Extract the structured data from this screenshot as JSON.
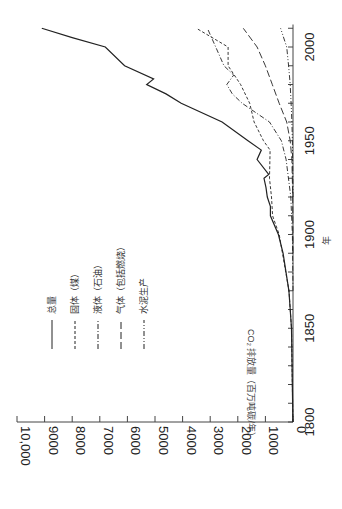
{
  "chart_data": {
    "type": "line",
    "orientation": "rotated-90",
    "title": "",
    "xlabel": "年",
    "ylabel": "CO₂ 排放量（百万吨碳/年）",
    "x_ticks": [
      "1800",
      "1850",
      "1900",
      "1950",
      "2000"
    ],
    "y_ticks": [
      "0",
      "1000",
      "2000",
      "3000",
      "4000",
      "5000",
      "6000",
      "7000",
      "8000",
      "9000",
      "10,000"
    ],
    "xlim": [
      1800,
      2012
    ],
    "ylim": [
      0,
      10000
    ],
    "grid": false,
    "legend_position": "upper-left (rotated)",
    "series": [
      {
        "name": "总量",
        "style": "solid",
        "x": [
          1800,
          1850,
          1870,
          1890,
          1900,
          1910,
          1915,
          1920,
          1925,
          1930,
          1932,
          1940,
          1945,
          1950,
          1960,
          1970,
          1975,
          1980,
          1983,
          1990,
          2000,
          2005,
          2010
        ],
        "values": [
          5,
          54,
          150,
          360,
          530,
          820,
          820,
          930,
          980,
          1050,
          880,
          1300,
          1150,
          1630,
          2570,
          4050,
          4600,
          5300,
          5050,
          6100,
          6800,
          8000,
          9100
        ]
      },
      {
        "name": "固体（煤）",
        "style": "dashed",
        "x": [
          1800,
          1850,
          1870,
          1900,
          1910,
          1920,
          1930,
          1945,
          1950,
          1960,
          1970,
          1980,
          1990,
          2000,
          2010
        ],
        "values": [
          5,
          54,
          145,
          500,
          740,
          780,
          850,
          830,
          1070,
          1410,
          1570,
          1900,
          2350,
          2350,
          3500
        ]
      },
      {
        "name": "液体（石油）",
        "style": "dash-dot",
        "x": [
          1870,
          1900,
          1920,
          1940,
          1950,
          1960,
          1970,
          1975,
          1980,
          1985,
          1990,
          2000,
          2010
        ],
        "values": [
          0,
          20,
          80,
          250,
          420,
          850,
          1840,
          2200,
          2400,
          2150,
          2500,
          2800,
          3100
        ]
      },
      {
        "name": "气体（包括燃烧）",
        "style": "long-dash",
        "x": [
          1890,
          1920,
          1940,
          1950,
          1960,
          1970,
          1980,
          1990,
          2000,
          2010
        ],
        "values": [
          0,
          10,
          40,
          100,
          230,
          500,
          750,
          1000,
          1300,
          1800
        ]
      },
      {
        "name": "水泥生产",
        "style": "dash-dot-dot",
        "x": [
          1920,
          1950,
          1960,
          1970,
          1980,
          1990,
          2000,
          2010
        ],
        "values": [
          0,
          20,
          40,
          70,
          100,
          160,
          230,
          450
        ]
      }
    ]
  },
  "axes": {
    "x_title": "年",
    "y_title": "CO₂ 排放量（百万吨碳/年）"
  },
  "legend": {
    "items": [
      {
        "label": "总量"
      },
      {
        "label": "固体（煤）"
      },
      {
        "label": "液体（石油）"
      },
      {
        "label": "气体（包括燃烧）"
      },
      {
        "label": "水泥生产"
      }
    ]
  }
}
